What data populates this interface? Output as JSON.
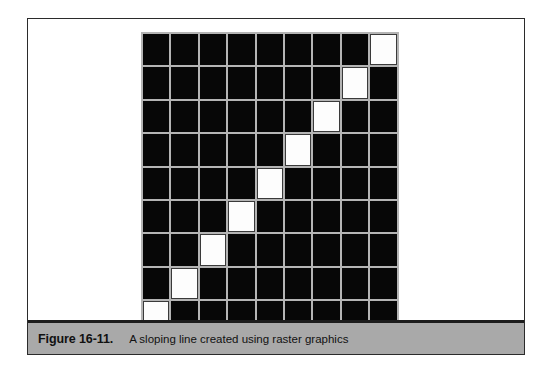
{
  "figure": {
    "caption_label": "Figure 16-11.",
    "caption_text": "A sloping line created using raster graphics",
    "colors": {
      "pixel_on": "#070707",
      "pixel_off": "#fdfdfd",
      "gridline": "#b4b4b4",
      "caption_bar": "#a9a9a9",
      "card_border": "#2b2b2b",
      "page_background": "#ffffff"
    }
  },
  "chart_data": {
    "type": "heatmap",
    "title": "A sloping line created using raster graphics",
    "xlabel": "",
    "ylabel": "",
    "rows": 9,
    "cols": 9,
    "grid": true,
    "legend": "none",
    "value_labels": {
      "0": "pixel off (white)",
      "1": "pixel on (black)"
    },
    "values": [
      [
        1,
        1,
        1,
        1,
        1,
        1,
        1,
        1,
        0
      ],
      [
        1,
        1,
        1,
        1,
        1,
        1,
        1,
        0,
        1
      ],
      [
        1,
        1,
        1,
        1,
        1,
        1,
        0,
        1,
        1
      ],
      [
        1,
        1,
        1,
        1,
        1,
        0,
        1,
        1,
        1
      ],
      [
        1,
        1,
        1,
        1,
        0,
        1,
        1,
        1,
        1
      ],
      [
        1,
        1,
        1,
        0,
        1,
        1,
        1,
        1,
        1
      ],
      [
        1,
        1,
        0,
        1,
        1,
        1,
        1,
        1,
        1
      ],
      [
        1,
        0,
        1,
        1,
        1,
        1,
        1,
        1,
        1
      ],
      [
        0,
        1,
        1,
        1,
        1,
        1,
        1,
        1,
        1
      ]
    ]
  }
}
